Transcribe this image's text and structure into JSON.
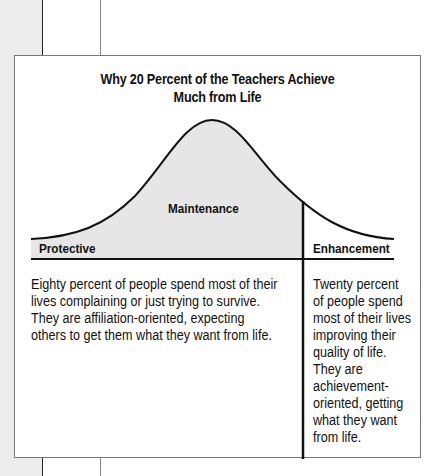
{
  "figure": {
    "title_line1": "Why 20 Percent of the Teachers Achieve",
    "title_line2": "Much from Life",
    "colors": {
      "curve_fill": "#e6e6e6",
      "line": "#111111",
      "margin_strip": "#ececec"
    },
    "curve_labels": {
      "center": "Maintenance",
      "left": "Protective",
      "right": "Enhancement"
    },
    "columns": {
      "left_text": "Eighty percent of people spend most of their lives complaining or just trying to survive.  They are affiliation-oriented, expecting others to get them what they want from life.",
      "right_text": "Twenty percent of people spend most of their lives improving their quality of life. They are achievement-oriented, getting what they want from life."
    },
    "split": {
      "left_percent": 80,
      "right_percent": 20
    }
  }
}
